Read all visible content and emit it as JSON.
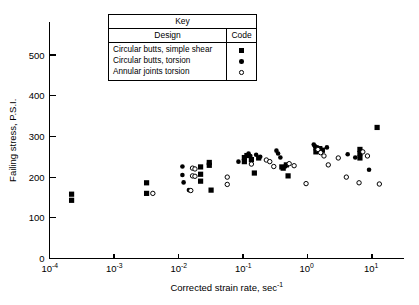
{
  "chart_data": {
    "type": "scatter",
    "title": "",
    "xlabel": "Corrected strain rate, sec",
    "xlabel_exponent": "-1",
    "ylabel": "Failing stress, P.S.I.",
    "xscale": "log",
    "yscale": "linear",
    "xlim": [
      0.0001,
      20
    ],
    "ylim": [
      0,
      560
    ],
    "xticks": [
      {
        "value": 0.0001,
        "base": "10",
        "exp": "-4"
      },
      {
        "value": 0.001,
        "base": "10",
        "exp": "-3"
      },
      {
        "value": 0.01,
        "base": "10",
        "exp": "-2"
      },
      {
        "value": 0.1,
        "base": "10",
        "exp": "-1"
      },
      {
        "value": 1,
        "base": "10",
        "exp": "0"
      },
      {
        "value": 10,
        "base": "10",
        "exp": "1"
      }
    ],
    "yticks": [
      {
        "value": 0,
        "label": "0"
      },
      {
        "value": 100,
        "label": "100"
      },
      {
        "value": 200,
        "label": "200"
      },
      {
        "value": 300,
        "label": "300"
      },
      {
        "value": 400,
        "label": "400"
      },
      {
        "value": 500,
        "label": "500"
      }
    ],
    "grid": false,
    "legend_position": "top-center",
    "series": [
      {
        "name": "Circular butts, simple shear",
        "marker": "filled-square",
        "color": "#000000",
        "points": [
          [
            0.00022,
            158
          ],
          [
            0.00022,
            143
          ],
          [
            0.0032,
            186
          ],
          [
            0.0032,
            160
          ],
          [
            0.022,
            225
          ],
          [
            0.022,
            207
          ],
          [
            0.022,
            190
          ],
          [
            0.03,
            236
          ],
          [
            0.03,
            229
          ],
          [
            0.032,
            168
          ],
          [
            0.105,
            248
          ],
          [
            0.105,
            238
          ],
          [
            0.115,
            253
          ],
          [
            0.135,
            243
          ],
          [
            0.15,
            210
          ],
          [
            0.175,
            247
          ],
          [
            0.4,
            225
          ],
          [
            0.42,
            222
          ],
          [
            0.47,
            230
          ],
          [
            0.5,
            203
          ],
          [
            1.35,
            272
          ],
          [
            1.35,
            262
          ],
          [
            1.55,
            270
          ],
          [
            1.7,
            266
          ],
          [
            6.5,
            268
          ],
          [
            6.5,
            258
          ],
          [
            6.5,
            247
          ],
          [
            12.0,
            322
          ]
        ]
      },
      {
        "name": "Circular butts, torsion",
        "marker": "filled-circle",
        "color": "#000000",
        "points": [
          [
            0.0115,
            226
          ],
          [
            0.0115,
            205
          ],
          [
            0.012,
            187
          ],
          [
            0.0145,
            168
          ],
          [
            0.085,
            238
          ],
          [
            0.122,
            258
          ],
          [
            0.13,
            252
          ],
          [
            0.16,
            255
          ],
          [
            0.185,
            250
          ],
          [
            0.33,
            265
          ],
          [
            0.35,
            258
          ],
          [
            0.38,
            248
          ],
          [
            0.45,
            226
          ],
          [
            1.25,
            280
          ],
          [
            1.3,
            276
          ],
          [
            1.45,
            272
          ],
          [
            1.6,
            268
          ],
          [
            2.0,
            273
          ],
          [
            4.2,
            256
          ],
          [
            5.5,
            248
          ],
          [
            9.0,
            218
          ]
        ]
      },
      {
        "name": "Annular joints torsion",
        "marker": "open-circle",
        "color": "#000000",
        "points": [
          [
            0.004,
            160
          ],
          [
            0.0165,
            222
          ],
          [
            0.018,
            220
          ],
          [
            0.0165,
            203
          ],
          [
            0.018,
            202
          ],
          [
            0.0155,
            167
          ],
          [
            0.057,
            200
          ],
          [
            0.057,
            182
          ],
          [
            0.135,
            232
          ],
          [
            0.23,
            242
          ],
          [
            0.26,
            238
          ],
          [
            0.3,
            226
          ],
          [
            0.52,
            233
          ],
          [
            0.62,
            228
          ],
          [
            0.95,
            184
          ],
          [
            1.45,
            268
          ],
          [
            1.6,
            260
          ],
          [
            1.8,
            252
          ],
          [
            2.1,
            230
          ],
          [
            3.0,
            247
          ],
          [
            4.0,
            200
          ],
          [
            6.3,
            186
          ],
          [
            7.2,
            262
          ],
          [
            8.5,
            252
          ],
          [
            13.0,
            183
          ]
        ]
      }
    ]
  },
  "legend": {
    "title": "Key",
    "columns": {
      "design": "Design",
      "code": "Code"
    },
    "rows": [
      {
        "design": "Circular  butts, simple  shear",
        "marker": "filled-square"
      },
      {
        "design": "Circular  butts,  torsion",
        "marker": "filled-circle"
      },
      {
        "design": "Annular   joints  torsion",
        "marker": "open-circle"
      }
    ]
  }
}
